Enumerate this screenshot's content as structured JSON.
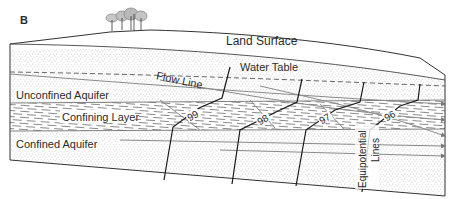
{
  "figure": {
    "panel_label": "B",
    "labels": {
      "land_surface": "Land Surface",
      "water_table": "Water Table",
      "flow_line": "Flow Line",
      "unconfined_aquifer": "Unconfined Aquifer",
      "confining_layer": "Confining Layer",
      "confined_aquifer": "Confined Aquifer",
      "equipotential_line1": "Equipotential",
      "equipotential_line2": "Lines"
    },
    "equipotential_values": [
      "99",
      "98",
      "97",
      "96"
    ],
    "colors": {
      "line": "#1a1a1a",
      "grey_line": "#8a8a8a",
      "stipple": "#9a9a9a",
      "dash": "#7a7a7a",
      "text": "#2b2b2b",
      "background": "#ffffff"
    }
  }
}
